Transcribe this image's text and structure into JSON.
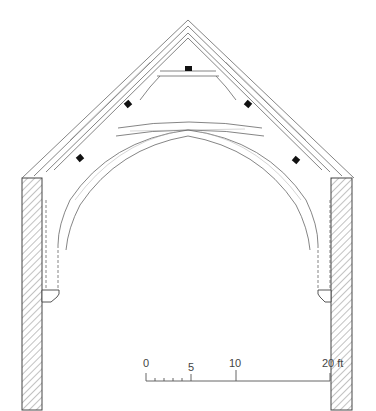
{
  "figure": {
    "ink_color": "#555555",
    "peg_color": "#111111",
    "background": "#ffffff"
  },
  "scale_bar": {
    "labels": [
      {
        "text": "0",
        "x": 146
      },
      {
        "text": "5",
        "x": 191
      },
      {
        "text": "10",
        "x": 236
      },
      {
        "text": "20 ft",
        "x": 326
      }
    ],
    "unit": "ft"
  }
}
